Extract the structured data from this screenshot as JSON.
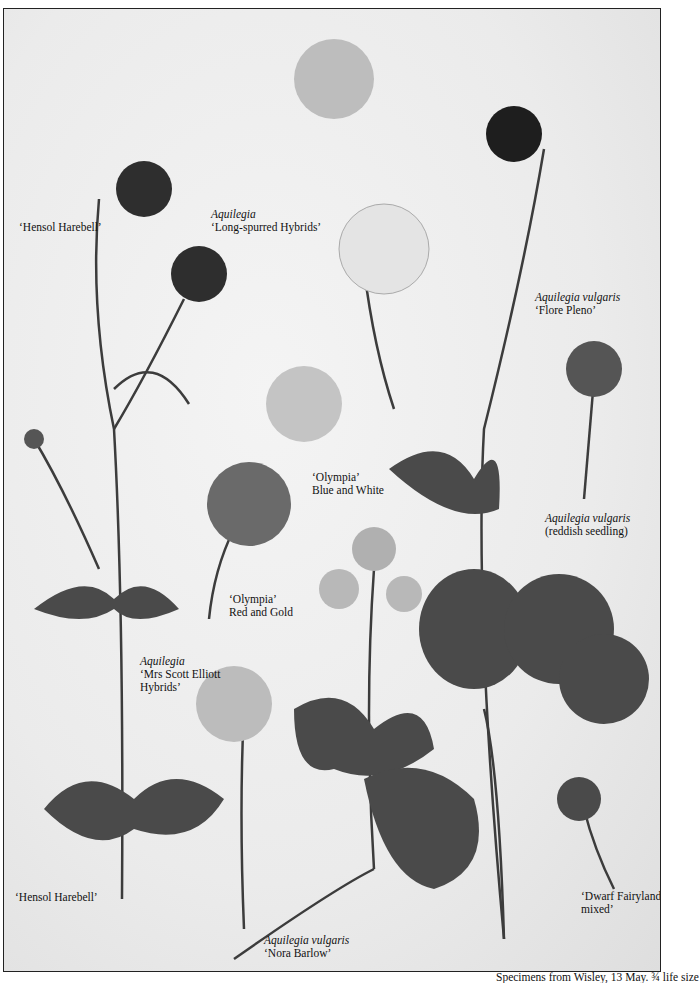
{
  "plate": {
    "caption": "Specimens from Wisley, 13 May. ¾ life size",
    "labels": [
      {
        "id": "hensol-top",
        "lines": [
          "‘Hensol Harebell’"
        ],
        "italic_first": false
      },
      {
        "id": "long-spurred",
        "lines": [
          "Aquilegia",
          "‘Long-spurred Hybrids’"
        ],
        "italic_first": true
      },
      {
        "id": "flore-pleno",
        "lines": [
          "Aquilegia vulgaris",
          "‘Flore Pleno’"
        ],
        "italic_first": true
      },
      {
        "id": "reddish-seedling",
        "lines": [
          "Aquilegia vulgaris",
          "(reddish seedling)"
        ],
        "italic_first": true
      },
      {
        "id": "olympia-blue",
        "lines": [
          "‘Olympia’",
          "Blue and White"
        ],
        "italic_first": false
      },
      {
        "id": "olympia-red",
        "lines": [
          "‘Olympia’",
          "Red and Gold"
        ],
        "italic_first": false
      },
      {
        "id": "mrs-scott-elliott",
        "lines": [
          "Aquilegia",
          "‘Mrs Scott Elliott",
          "Hybrids’"
        ],
        "italic_first": true
      },
      {
        "id": "hensol-bottom",
        "lines": [
          "‘Hensol Harebell’"
        ],
        "italic_first": false
      },
      {
        "id": "nora-barlow",
        "lines": [
          "Aquilegia vulgaris",
          "‘Nora Barlow’"
        ],
        "italic_first": true
      },
      {
        "id": "dwarf-fairyland",
        "lines": [
          "‘Dwarf Fairyland",
          "mixed’"
        ],
        "italic_first": false
      }
    ]
  },
  "colors": {
    "stem": "#3c3c3c",
    "leaf": "#4a4a4a",
    "petal_dark": "#2e2e2e",
    "petal_light": "#cfcfcf",
    "border": "#222222"
  }
}
